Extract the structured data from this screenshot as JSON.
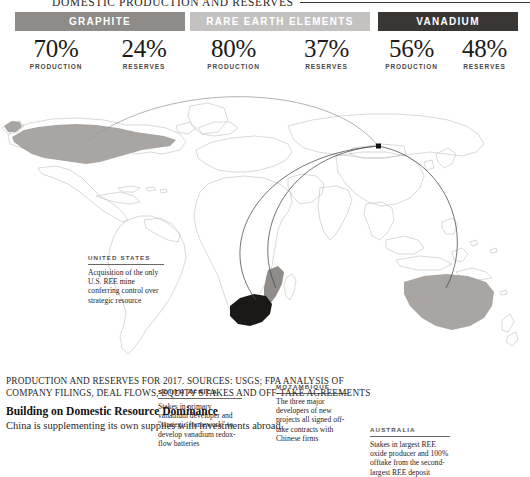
{
  "top_title": {
    "text": "DOMESTIC PRODUCTION AND RESERVES"
  },
  "stats": {
    "production_label": "PRODUCTION",
    "reserves_label": "RESERVES",
    "cards": [
      {
        "name": "GRAPHITE",
        "banner_color": "#8e8b88",
        "production": "70%",
        "reserves": "24%"
      },
      {
        "name": "RARE EARTH ELEMENTS",
        "banner_color": "#c4c2c0",
        "production": "80%",
        "reserves": "37%"
      },
      {
        "name": "VANADIUM",
        "banner_color": "#3a3634",
        "production": "56%",
        "reserves": "48%"
      }
    ]
  },
  "map": {
    "destination_marker": "beijing-dot",
    "highlight_color_light": "#a8a5a2",
    "highlight_color_dark": "#1b1917",
    "outline_color": "#b9b6b3",
    "arc_color": "#4a4744",
    "callouts": [
      {
        "id": "united-states",
        "title": "UNITED STATES",
        "body": "Acquisition of the only U.S. REE mine conferring control over strategic resource"
      },
      {
        "id": "south-africa",
        "title": "SOUTH AFRICA",
        "body": "Stakes in primary vanadium developer and \"strategic framework\" to develop vanadium redox-flow batteries"
      },
      {
        "id": "mozambique",
        "title": "MOZAMBIQUE",
        "body": "The three major developers of new projects all signed off-take contracts with Chinese firms"
      },
      {
        "id": "australia",
        "title": "AUSTRALIA",
        "body": "Stakes in largest REE oxide producer and 100% offtake from the second-largest REE deposit"
      }
    ]
  },
  "source_note": "PRODUCTION AND RESERVES FOR 2017. SOURCES: USGS; FPA ANALYSIS OF COMPANY FILINGS, DEAL FLOWS, EQUITY STAKES AND OFF-TAKE AGREEMENTS",
  "footer": {
    "heading": "Building on Domestic Resource Dominance",
    "subheading": "China is supplementing its own supplies with investments abroad."
  }
}
